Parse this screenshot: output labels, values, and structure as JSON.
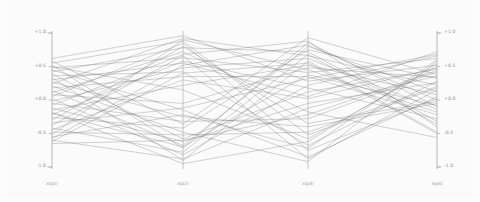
{
  "figure": {
    "background_color": "#fbfbfb",
    "line_color": "#6e6e6e",
    "axis_color": "#b0b0b0",
    "label_color": "#8c8c8c",
    "width": 480,
    "height": 202
  },
  "chart_data": {
    "type": "line",
    "subtype": "parallel-coordinates",
    "title": "",
    "xlabel": "",
    "ylabel": "",
    "ylim": [
      -1.0,
      1.0
    ],
    "grid": false,
    "legend": "none",
    "axes": [
      {
        "name": "x(p1)",
        "x_px": 52,
        "ticks_side": "left"
      },
      {
        "name": "x(p2)",
        "x_px": 183,
        "ticks_side": "none"
      },
      {
        "name": "x(p3)",
        "x_px": 308,
        "ticks_side": "none"
      },
      {
        "name": "x(p4)",
        "x_px": 437,
        "ticks_side": "right"
      }
    ],
    "categories": [
      "x(p1)",
      "x(p2)",
      "x(p3)",
      "x(p4)"
    ],
    "tick_values": [
      1.0,
      0.5,
      0.0,
      -0.5,
      -1.0
    ],
    "tick_labels": [
      "+1.0",
      "+0.5",
      "+0.0",
      "-0.5",
      "-1.0"
    ],
    "series": [
      {
        "name": "s01",
        "values": [
          0.62,
          0.96,
          0.28,
          0.52
        ]
      },
      {
        "name": "s02",
        "values": [
          0.58,
          -0.36,
          0.93,
          0.38
        ]
      },
      {
        "name": "s03",
        "values": [
          0.55,
          0.88,
          -0.52,
          0.18
        ]
      },
      {
        "name": "s04",
        "values": [
          0.52,
          -0.72,
          0.86,
          -0.1
        ]
      },
      {
        "name": "s05",
        "values": [
          0.48,
          0.63,
          0.41,
          0.62
        ]
      },
      {
        "name": "s06",
        "values": [
          0.45,
          -0.15,
          -0.85,
          0.05
        ]
      },
      {
        "name": "s07",
        "values": [
          0.42,
          0.78,
          0.72,
          -0.32
        ]
      },
      {
        "name": "s08",
        "values": [
          0.39,
          -0.58,
          0.12,
          0.46
        ]
      },
      {
        "name": "s09",
        "values": [
          0.36,
          0.42,
          -0.68,
          0.28
        ]
      },
      {
        "name": "s10",
        "values": [
          0.33,
          -0.9,
          0.58,
          -0.48
        ]
      },
      {
        "name": "s11",
        "values": [
          0.3,
          0.55,
          0.05,
          0.72
        ]
      },
      {
        "name": "s12",
        "values": [
          0.27,
          -0.25,
          -0.4,
          -0.05
        ]
      },
      {
        "name": "s13",
        "values": [
          0.24,
          0.92,
          0.66,
          0.22
        ]
      },
      {
        "name": "s14",
        "values": [
          0.21,
          -0.48,
          -0.92,
          0.58
        ]
      },
      {
        "name": "s15",
        "values": [
          0.18,
          0.35,
          0.35,
          -0.22
        ]
      },
      {
        "name": "s16",
        "values": [
          0.14,
          -0.68,
          0.8,
          0.12
        ]
      },
      {
        "name": "s17",
        "values": [
          0.11,
          0.72,
          -0.18,
          -0.56
        ]
      },
      {
        "name": "s18",
        "values": [
          0.08,
          -0.05,
          0.48,
          0.34
        ]
      },
      {
        "name": "s19",
        "values": [
          0.05,
          0.85,
          -0.75,
          0.02
        ]
      },
      {
        "name": "s20",
        "values": [
          0.02,
          -0.82,
          0.22,
          0.66
        ]
      },
      {
        "name": "s21",
        "values": [
          -0.02,
          0.48,
          0.62,
          -0.14
        ]
      },
      {
        "name": "s22",
        "values": [
          -0.05,
          -0.32,
          -0.28,
          0.42
        ]
      },
      {
        "name": "s23",
        "values": [
          -0.08,
          0.68,
          0.88,
          -0.4
        ]
      },
      {
        "name": "s24",
        "values": [
          -0.12,
          -0.62,
          -0.05,
          0.26
        ]
      },
      {
        "name": "s25",
        "values": [
          -0.15,
          0.22,
          0.52,
          0.08
        ]
      },
      {
        "name": "s26",
        "values": [
          -0.18,
          -0.95,
          -0.62,
          0.54
        ]
      },
      {
        "name": "s27",
        "values": [
          -0.22,
          0.58,
          0.18,
          -0.28
        ]
      },
      {
        "name": "s28",
        "values": [
          -0.26,
          -0.42,
          0.75,
          0.32
        ]
      },
      {
        "name": "s29",
        "values": [
          -0.3,
          0.8,
          -0.35,
          -0.02
        ]
      },
      {
        "name": "s30",
        "values": [
          -0.34,
          -0.12,
          0.32,
          0.68
        ]
      },
      {
        "name": "s31",
        "values": [
          -0.38,
          0.66,
          -0.88,
          0.15
        ]
      },
      {
        "name": "s32",
        "values": [
          -0.42,
          -0.78,
          0.68,
          -0.36
        ]
      },
      {
        "name": "s33",
        "values": [
          -0.45,
          0.3,
          0.02,
          0.48
        ]
      },
      {
        "name": "s34",
        "values": [
          -0.48,
          -0.52,
          -0.48,
          0.2
        ]
      },
      {
        "name": "s35",
        "values": [
          -0.52,
          0.9,
          0.45,
          -0.18
        ]
      },
      {
        "name": "s36",
        "values": [
          -0.55,
          -0.22,
          -0.72,
          0.6
        ]
      },
      {
        "name": "s37",
        "values": [
          -0.58,
          0.52,
          0.82,
          0.0
        ]
      },
      {
        "name": "s38",
        "values": [
          -0.6,
          -0.88,
          -0.12,
          0.36
        ]
      },
      {
        "name": "s39",
        "values": [
          -0.62,
          0.4,
          0.55,
          -0.5
        ]
      },
      {
        "name": "s40",
        "values": [
          -0.65,
          -0.6,
          -0.22,
          0.44
        ]
      },
      {
        "name": "s41",
        "values": [
          0.5,
          0.15,
          -0.58,
          0.5
        ]
      },
      {
        "name": "s42",
        "values": [
          -0.2,
          -0.7,
          0.38,
          -0.08
        ]
      }
    ]
  }
}
